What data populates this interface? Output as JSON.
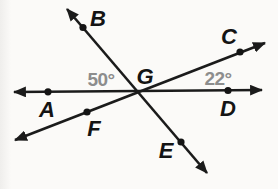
{
  "figure": {
    "type": "geometry-diagram",
    "description_visible_elements": "three lines intersecting at one point",
    "points": {
      "A": "A",
      "B": "B",
      "C": "C",
      "D": "D",
      "E": "E",
      "F": "F",
      "G": "G"
    },
    "angles": {
      "BGA": "50°",
      "CGD": "22°"
    },
    "colors": {
      "line": "#1b1b1b",
      "point_label": "#141414",
      "angle_label": "#8d8d8d",
      "background": "#fbfaf8"
    }
  }
}
